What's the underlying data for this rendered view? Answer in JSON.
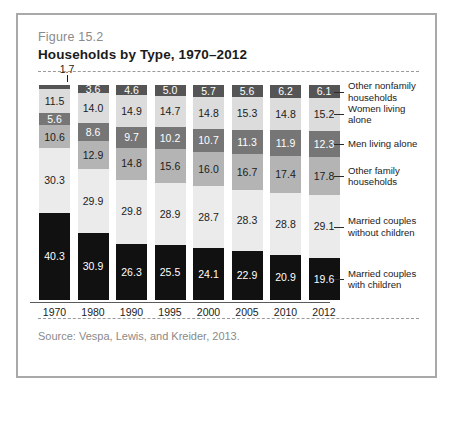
{
  "figure": {
    "number": "Figure 15.2",
    "title": "Households by Type, 1970–2012",
    "source": "Source:  Vespa, Lewis, and Kreider, 2013."
  },
  "chart_data": {
    "type": "bar",
    "stacked": true,
    "title": "Households by Type, 1970–2012",
    "xlabel": "",
    "ylabel": "",
    "ylim": [
      0,
      100
    ],
    "grid": false,
    "legend_position": "right",
    "units": "percent",
    "categories": [
      "1970",
      "1980",
      "1990",
      "1995",
      "2000",
      "2005",
      "2010",
      "2012"
    ],
    "series": [
      {
        "name": "Other nonfamily households",
        "color": "#555555",
        "values": [
          1.7,
          3.6,
          4.6,
          5.0,
          5.7,
          5.6,
          6.2,
          6.1
        ]
      },
      {
        "name": "Women living alone",
        "color": "#dcdcdc",
        "values": [
          11.5,
          14.0,
          14.9,
          14.7,
          14.8,
          15.3,
          14.8,
          15.2
        ]
      },
      {
        "name": "Men living alone",
        "color": "#767676",
        "values": [
          5.6,
          8.6,
          9.7,
          10.2,
          10.7,
          11.3,
          11.9,
          12.3
        ]
      },
      {
        "name": "Other family households",
        "color": "#b4b4b4",
        "values": [
          10.6,
          12.9,
          14.8,
          15.6,
          16.0,
          16.7,
          17.4,
          17.8
        ]
      },
      {
        "name": "Married couples without children",
        "color": "#ebebeb",
        "values": [
          30.3,
          29.9,
          29.8,
          28.9,
          28.7,
          28.3,
          28.8,
          29.1
        ]
      },
      {
        "name": "Married couples with children",
        "color": "#111111",
        "values": [
          40.3,
          30.9,
          26.3,
          25.5,
          24.1,
          22.9,
          20.9,
          19.6
        ]
      }
    ]
  },
  "legend": [
    {
      "line1": "Other nonfamily",
      "line2": "households"
    },
    {
      "line1": "Women living",
      "line2": "alone"
    },
    {
      "line1": "Men living alone",
      "line2": ""
    },
    {
      "line1": "Other family",
      "line2": "households"
    },
    {
      "line1": "Married couples",
      "line2": "without children"
    },
    {
      "line1": "Married couples",
      "line2": "with children"
    }
  ]
}
